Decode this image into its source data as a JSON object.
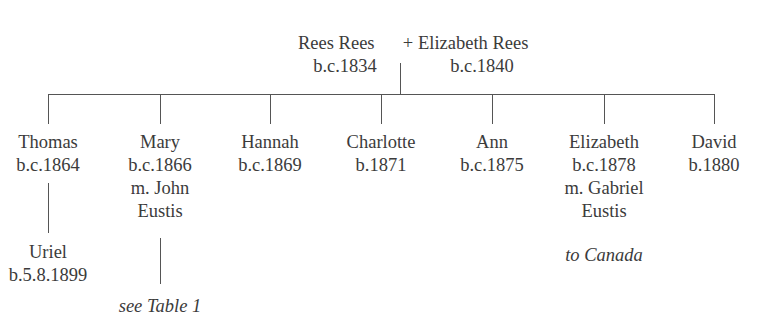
{
  "parents": {
    "father": {
      "name": "Rees Rees",
      "born": "b.c.1834"
    },
    "joiner": "+",
    "mother": {
      "name": "Elizabeth Rees",
      "born": "b.c.1840"
    }
  },
  "children": [
    {
      "name": "Thomas",
      "born": "b.c.1864",
      "child": {
        "name": "Uriel",
        "born": "b.5.8.1899"
      }
    },
    {
      "name": "Mary",
      "born": "b.c.1866",
      "married_line1": "m. John",
      "married_line2": "Eustis",
      "note": "see Table 1"
    },
    {
      "name": "Hannah",
      "born": "b.c.1869"
    },
    {
      "name": "Charlotte",
      "born": "b.1871"
    },
    {
      "name": "Ann",
      "born": "b.c.1875"
    },
    {
      "name": "Elizabeth",
      "born": "b.c.1878",
      "married_line1": "m. Gabriel",
      "married_line2": "Eustis",
      "note": "to Canada"
    },
    {
      "name": "David",
      "born": "b.1880"
    }
  ]
}
